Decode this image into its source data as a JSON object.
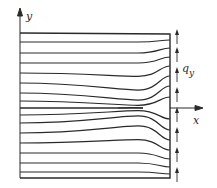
{
  "figure": {
    "axes": {
      "y_label": "y",
      "x_label": "x"
    },
    "load_label": {
      "main": "q",
      "subscript": "y"
    },
    "colors": {
      "line": "#2a2a2a",
      "background": "#ffffff"
    },
    "plate": {
      "left": 20,
      "right": 170,
      "top": 33,
      "bottom": 178
    },
    "crack": {
      "y": 108,
      "tip_x": 143
    },
    "flow_lines_left_y": [
      42,
      53,
      63,
      73,
      83,
      93,
      101,
      115,
      123,
      133,
      143,
      153,
      163,
      172
    ],
    "flow_lines_right_y": [
      40,
      48,
      57,
      66,
      76,
      86,
      97,
      119,
      130,
      140,
      150,
      159,
      167,
      174
    ],
    "load_arrows_y": [
      40,
      58,
      78,
      98,
      118,
      138,
      158,
      178
    ]
  }
}
